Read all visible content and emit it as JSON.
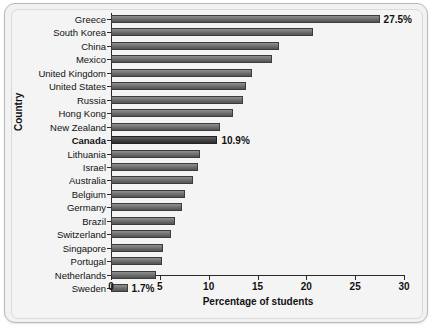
{
  "chart_data": {
    "type": "bar",
    "orientation": "horizontal",
    "title": "",
    "xlabel": "Percentage of students",
    "ylabel": "Country",
    "xlim": [
      0,
      30
    ],
    "xticks": [
      0,
      5,
      10,
      15,
      20,
      25,
      30
    ],
    "grid": false,
    "legend": null,
    "categories": [
      "Greece",
      "South Korea",
      "China",
      "Mexico",
      "United Kingdom",
      "United States",
      "Russia",
      "Hong Kong",
      "New Zealand",
      "Canada",
      "Lithuania",
      "Israel",
      "Australia",
      "Belgium",
      "Germany",
      "Brazil",
      "Switzerland",
      "Singapore",
      "Portugal",
      "Netherlands",
      "Sweden"
    ],
    "values": [
      27.5,
      20.7,
      17.2,
      16.5,
      14.4,
      13.8,
      13.5,
      12.5,
      11.2,
      10.9,
      9.1,
      8.9,
      8.4,
      7.6,
      7.3,
      6.6,
      6.1,
      5.3,
      5.2,
      4.6,
      1.7
    ],
    "bars": [
      {
        "label": "Greece",
        "value": 27.5,
        "data_label": "27.5%",
        "emphasis": false
      },
      {
        "label": "South Korea",
        "value": 20.7,
        "data_label": "",
        "emphasis": false
      },
      {
        "label": "China",
        "value": 17.2,
        "data_label": "",
        "emphasis": false
      },
      {
        "label": "Mexico",
        "value": 16.5,
        "data_label": "",
        "emphasis": false
      },
      {
        "label": "United Kingdom",
        "value": 14.4,
        "data_label": "",
        "emphasis": false
      },
      {
        "label": "United States",
        "value": 13.8,
        "data_label": "",
        "emphasis": false
      },
      {
        "label": "Russia",
        "value": 13.5,
        "data_label": "",
        "emphasis": false
      },
      {
        "label": "Hong Kong",
        "value": 12.5,
        "data_label": "",
        "emphasis": false
      },
      {
        "label": "New Zealand",
        "value": 11.2,
        "data_label": "",
        "emphasis": false
      },
      {
        "label": "Canada",
        "value": 10.9,
        "data_label": "10.9%",
        "emphasis": true
      },
      {
        "label": "Lithuania",
        "value": 9.1,
        "data_label": "",
        "emphasis": false
      },
      {
        "label": "Israel",
        "value": 8.9,
        "data_label": "",
        "emphasis": false
      },
      {
        "label": "Australia",
        "value": 8.4,
        "data_label": "",
        "emphasis": false
      },
      {
        "label": "Belgium",
        "value": 7.6,
        "data_label": "",
        "emphasis": false
      },
      {
        "label": "Germany",
        "value": 7.3,
        "data_label": "",
        "emphasis": false
      },
      {
        "label": "Brazil",
        "value": 6.6,
        "data_label": "",
        "emphasis": false
      },
      {
        "label": "Switzerland",
        "value": 6.1,
        "data_label": "",
        "emphasis": false
      },
      {
        "label": "Singapore",
        "value": 5.3,
        "data_label": "",
        "emphasis": false
      },
      {
        "label": "Portugal",
        "value": 5.2,
        "data_label": "",
        "emphasis": false
      },
      {
        "label": "Netherlands",
        "value": 4.6,
        "data_label": "",
        "emphasis": false
      },
      {
        "label": "Sweden",
        "value": 1.7,
        "data_label": "1.7%",
        "emphasis": false
      }
    ],
    "colors": {
      "bar_top": "#8e8e8e",
      "bar_bottom": "#545454",
      "bar_highlight": "#383838",
      "bar_border": "#3c3c3c",
      "axis": "#2a2a2a",
      "text": "#111111",
      "background": "#f4f4f4",
      "frame_border": "#b9b9b9"
    }
  }
}
